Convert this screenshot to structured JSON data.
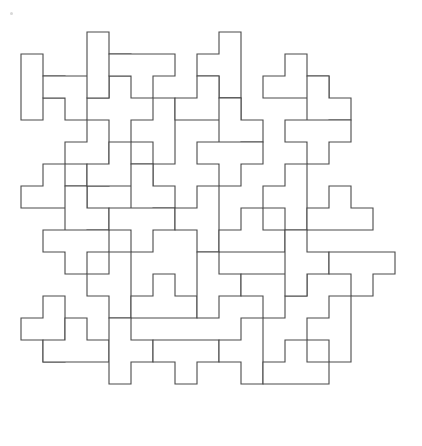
{
  "figure": {
    "background_color": "#ffffff",
    "stroke_color": "#4a4a4a",
    "stroke_width": 1.1
  },
  "grid": {
    "origin_x": 21,
    "origin_y": 32,
    "cell": 22,
    "cols": 17,
    "rows": 18
  },
  "artifact": {
    "name": "scan-speck",
    "x": 10,
    "y": 12,
    "color": "#d8d8d8"
  },
  "tiles": [
    {
      "id": 1,
      "orient": "T-right",
      "col": 0,
      "row": 1
    },
    {
      "id": 2,
      "orient": "T-down",
      "col": 1,
      "row": 2
    },
    {
      "id": 3,
      "orient": "T-left",
      "col": 2,
      "row": 4
    },
    {
      "id": 4,
      "orient": "T-up",
      "col": 0,
      "row": 6
    },
    {
      "id": 5,
      "orient": "T-right",
      "col": 2,
      "row": 7
    },
    {
      "id": 6,
      "orient": "T-down",
      "col": 1,
      "row": 9
    },
    {
      "id": 7,
      "orient": "T-left",
      "col": 0,
      "row": 12
    },
    {
      "id": 8,
      "orient": "T-up",
      "col": 1,
      "row": 13
    },
    {
      "id": 9,
      "orient": "T-right",
      "col": 3,
      "row": 0
    },
    {
      "id": 10,
      "orient": "T-down",
      "col": 4,
      "row": 1
    },
    {
      "id": 11,
      "orient": "T-left",
      "col": 5,
      "row": 3
    },
    {
      "id": 12,
      "orient": "T-up",
      "col": 3,
      "row": 5
    },
    {
      "id": 13,
      "orient": "T-right",
      "col": 5,
      "row": 6
    },
    {
      "id": 14,
      "orient": "T-down",
      "col": 4,
      "row": 8
    },
    {
      "id": 15,
      "orient": "T-left",
      "col": 3,
      "row": 10
    },
    {
      "id": 16,
      "orient": "T-up",
      "col": 5,
      "row": 11
    },
    {
      "id": 17,
      "orient": "T-right",
      "col": 4,
      "row": 13
    },
    {
      "id": 18,
      "orient": "T-down",
      "col": 6,
      "row": 14
    },
    {
      "id": 19,
      "orient": "T-left",
      "col": 8,
      "row": 0
    },
    {
      "id": 20,
      "orient": "T-up",
      "col": 7,
      "row": 2
    },
    {
      "id": 21,
      "orient": "T-right",
      "col": 9,
      "row": 3
    },
    {
      "id": 22,
      "orient": "T-down",
      "col": 8,
      "row": 5
    },
    {
      "id": 23,
      "orient": "T-left",
      "col": 7,
      "row": 7
    },
    {
      "id": 24,
      "orient": "T-up",
      "col": 9,
      "row": 8
    },
    {
      "id": 25,
      "orient": "T-right",
      "col": 8,
      "row": 10
    },
    {
      "id": 26,
      "orient": "T-down",
      "col": 10,
      "row": 11
    },
    {
      "id": 27,
      "orient": "T-left",
      "col": 9,
      "row": 13
    },
    {
      "id": 28,
      "orient": "T-up",
      "col": 11,
      "row": 1
    },
    {
      "id": 29,
      "orient": "T-right",
      "col": 13,
      "row": 2
    },
    {
      "id": 30,
      "orient": "T-down",
      "col": 12,
      "row": 4
    },
    {
      "id": 31,
      "orient": "T-left",
      "col": 11,
      "row": 6
    },
    {
      "id": 32,
      "orient": "T-up",
      "col": 13,
      "row": 7
    },
    {
      "id": 33,
      "orient": "T-right",
      "col": 12,
      "row": 9
    },
    {
      "id": 34,
      "orient": "T-down",
      "col": 14,
      "row": 10
    },
    {
      "id": 35,
      "orient": "T-left",
      "col": 13,
      "row": 12
    },
    {
      "id": 36,
      "orient": "T-up",
      "col": 11,
      "row": 14
    }
  ],
  "outline_path": "M 21 32 L 394 32 L 394 418 L 21 418 Z"
}
